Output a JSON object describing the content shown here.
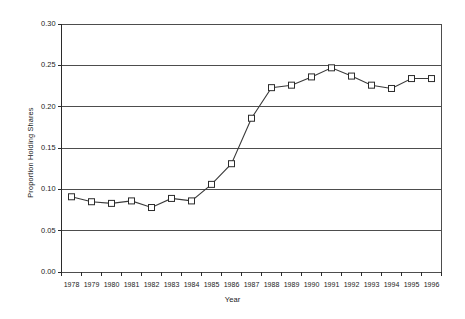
{
  "chart_data": {
    "type": "line",
    "title": "",
    "subtitle": "",
    "xlabel": "Year",
    "ylabel": "Proportion Holding Shares",
    "categories": [
      1978,
      1979,
      1980,
      1981,
      1982,
      1983,
      1984,
      1985,
      1986,
      1987,
      1988,
      1989,
      1990,
      1991,
      1992,
      1993,
      1994,
      1995,
      1996
    ],
    "x_tick_labels": [
      "1978",
      "1979",
      "1980",
      "1981",
      "1982",
      "1983",
      "1984",
      "1985",
      "1986",
      "1987",
      "1988",
      "1989",
      "1990",
      "1991",
      "1992",
      "1993",
      "1994",
      "1995",
      "1996"
    ],
    "values": [
      0.091,
      0.085,
      0.083,
      0.086,
      0.078,
      0.089,
      0.086,
      0.106,
      0.131,
      0.186,
      0.223,
      0.226,
      0.236,
      0.247,
      0.237,
      0.226,
      0.222,
      0.234,
      0.234
    ],
    "series": [
      {
        "name": "Proportion Holding Shares",
        "values": [
          0.091,
          0.085,
          0.083,
          0.086,
          0.078,
          0.089,
          0.086,
          0.106,
          0.131,
          0.186,
          0.223,
          0.226,
          0.236,
          0.247,
          0.237,
          0.226,
          0.222,
          0.234,
          0.234
        ],
        "marker": "open-square",
        "line_color": "#3a3a3a",
        "marker_fill": "#ffffff",
        "marker_stroke": "#2b2b2b"
      }
    ],
    "ylim": [
      0.0,
      0.3
    ],
    "y_ticks": [
      0.0,
      0.05,
      0.1,
      0.15,
      0.2,
      0.25,
      0.3
    ],
    "y_tick_labels": [
      "0.00",
      "0.05",
      "0.10",
      "0.15",
      "0.20",
      "0.25",
      "0.30"
    ],
    "grid": {
      "horizontal": true,
      "vertical": false,
      "color": "#4d4d4d"
    },
    "legend": {
      "visible": false,
      "position": "none"
    },
    "plot_border": true,
    "background_color": "#ffffff"
  }
}
